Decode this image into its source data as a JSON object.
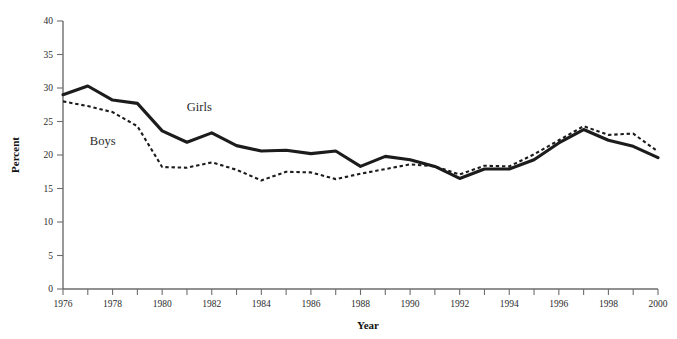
{
  "figure": {
    "background": "#ffffff",
    "ink_color": "#1c1c1c",
    "axis_color": "#6d6d6d",
    "cropped_title": ""
  },
  "axes": {
    "y_title": "Percent",
    "x_title": "Year",
    "y_ticks": [
      "0",
      "5",
      "10",
      "15",
      "20",
      "25",
      "30",
      "35",
      "40"
    ],
    "x_ticks_labeled": [
      "1976",
      "1978",
      "1980",
      "1982",
      "1984",
      "1986",
      "1988",
      "1990",
      "1992",
      "1994",
      "1996",
      "1998",
      "2000"
    ]
  },
  "labels": {
    "girls": "Girls",
    "boys": "Boys"
  },
  "chart_data": {
    "type": "line",
    "title": "",
    "subtitle": "",
    "xlabel": "Year",
    "ylabel": "Percent",
    "xlim": [
      1976,
      2000
    ],
    "ylim": [
      0,
      40
    ],
    "ytick_step": 5,
    "xtick_step": 1,
    "xtick_label_step": 2,
    "grid": false,
    "legend": "inline-annotations",
    "legend_position": "in-plot",
    "x": [
      1976,
      1977,
      1978,
      1979,
      1980,
      1981,
      1982,
      1983,
      1984,
      1985,
      1986,
      1987,
      1988,
      1989,
      1990,
      1991,
      1992,
      1993,
      1994,
      1995,
      1996,
      1997,
      1998,
      1999,
      2000
    ],
    "series": [
      {
        "name": "Girls",
        "style": "solid",
        "values": [
          29.0,
          30.3,
          28.2,
          27.7,
          23.6,
          21.9,
          23.3,
          21.4,
          20.6,
          20.7,
          20.2,
          20.6,
          18.3,
          19.8,
          19.3,
          18.3,
          16.5,
          17.9,
          17.9,
          19.3,
          21.8,
          23.8,
          22.2,
          21.3,
          19.6
        ]
      },
      {
        "name": "Boys",
        "style": "dashed",
        "values": [
          28.0,
          27.3,
          26.4,
          24.3,
          18.2,
          18.1,
          18.9,
          17.8,
          16.2,
          17.5,
          17.4,
          16.4,
          17.2,
          17.9,
          18.6,
          18.3,
          17.1,
          18.4,
          18.3,
          20.1,
          22.2,
          24.3,
          23.0,
          23.2,
          20.5
        ]
      }
    ],
    "annotations": [
      {
        "text": "Girls",
        "x": 1981.5,
        "y": 26.5
      },
      {
        "text": "Boys",
        "x": 1977.6,
        "y": 21.5
      }
    ]
  }
}
